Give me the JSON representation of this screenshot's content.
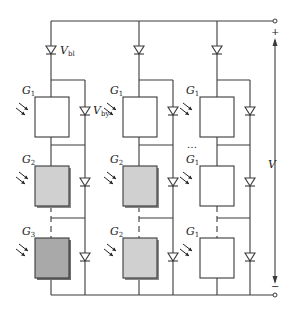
{
  "diagram": {
    "labels": {
      "blocking_diode": "V",
      "blocking_diode_sub": "bl",
      "bypass_diode": "V",
      "bypass_diode_sub": "by",
      "voltage": "V",
      "plus": "+",
      "minus": "−",
      "ellipsis": "…"
    },
    "columns": [
      {
        "cells": [
          {
            "label": "G",
            "sub": "1",
            "fill": "#ffffff"
          },
          {
            "label": "G",
            "sub": "2",
            "fill": "#d0d0d0"
          },
          {
            "label": "G",
            "sub": "3",
            "fill": "#a9a9a9"
          }
        ]
      },
      {
        "cells": [
          {
            "label": "G",
            "sub": "1",
            "fill": "#ffffff"
          },
          {
            "label": "G",
            "sub": "2",
            "fill": "#d0d0d0"
          },
          {
            "label": "G",
            "sub": "2",
            "fill": "#d0d0d0"
          }
        ]
      },
      {
        "cells": [
          {
            "label": "G",
            "sub": "1",
            "fill": "#ffffff"
          },
          {
            "label": "G",
            "sub": "1",
            "fill": "#ffffff"
          },
          {
            "label": "G",
            "sub": "1",
            "fill": "#ffffff"
          }
        ]
      }
    ],
    "colors": {
      "wire": "#3a3a3a",
      "background": "#ffffff",
      "shadow": "#8a8a8a"
    }
  }
}
